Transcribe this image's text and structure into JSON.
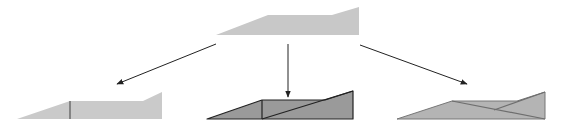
{
  "diagram": {
    "colors": {
      "source_fill": "#c8c8c8",
      "left_fill": "#cacaca",
      "middle_fill": "#9a9a9a",
      "right_fill": "#b4b4b4",
      "outline_dark": "#333333",
      "outline_gray": "#6e6e6e",
      "arrow": "#222222"
    },
    "source_shape": {
      "name": "source-ramp"
    },
    "targets": [
      {
        "name": "ramp-split-vertical"
      },
      {
        "name": "ramp-split-vertical-diagonal"
      },
      {
        "name": "ramp-split-crossing-diagonals"
      }
    ],
    "arrows": [
      {
        "name": "arrow-to-left"
      },
      {
        "name": "arrow-to-middle"
      },
      {
        "name": "arrow-to-right"
      }
    ]
  }
}
